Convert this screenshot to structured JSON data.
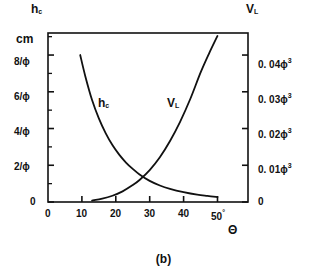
{
  "figure": {
    "caption": "(b)",
    "left_axis_name": "h",
    "left_axis_name_sub": "c",
    "left_axis_unit": "cm",
    "right_axis_name": "V",
    "right_axis_name_sub": "L",
    "x_axis_name": "Θ",
    "degree_mark": "°"
  },
  "curve_labels": {
    "hc": "h",
    "hc_sub": "c",
    "vl": "V",
    "vl_sub": "L"
  },
  "ticks": {
    "left": [
      "8/ϕ",
      "6/ϕ",
      "4/ϕ",
      "2/ϕ",
      "0"
    ],
    "right": [
      "0. 04ϕ",
      "0. 03ϕ",
      "0. 02ϕ",
      "0. 01ϕ",
      "0"
    ],
    "right_exp": "3",
    "x": [
      "0",
      "10",
      "20",
      "30",
      "40",
      "50"
    ]
  },
  "colors": {
    "axis": "#111111",
    "curve": "#111111",
    "background": "#ffffff"
  },
  "chart_data": {
    "type": "line",
    "title": "(b)",
    "xlabel": "Θ",
    "ylabel": "h_c (cm)",
    "y2label": "V_L",
    "grid": false,
    "legend": "inline-curve-labels",
    "xlim": [
      0,
      59
    ],
    "ylim": [
      0,
      9.2
    ],
    "y2lim": [
      0,
      0.046
    ],
    "xticks": [
      0,
      10,
      20,
      30,
      40,
      50
    ],
    "xticklabels": [
      "0",
      "10",
      "20",
      "30",
      "40",
      "50°"
    ],
    "yticks": [
      0,
      2,
      4,
      6,
      8
    ],
    "yticklabels": [
      "0",
      "2/ϕ",
      "4/ϕ",
      "6/ϕ",
      "8/ϕ"
    ],
    "y2ticks": [
      0,
      0.01,
      0.02,
      0.03,
      0.04
    ],
    "y2ticklabels": [
      "0",
      "0. 01ϕ³",
      "0. 02ϕ³",
      "0. 03ϕ³",
      "0. 04ϕ³"
    ],
    "series": [
      {
        "name": "h_c",
        "axis": "left",
        "x": [
          9.5,
          11,
          13,
          15,
          17,
          19,
          21,
          23,
          25,
          27,
          30,
          33,
          36,
          40,
          44,
          47,
          50
        ],
        "y": [
          8.0,
          6.85,
          5.55,
          4.55,
          3.75,
          3.1,
          2.58,
          2.15,
          1.8,
          1.5,
          1.15,
          0.9,
          0.72,
          0.54,
          0.4,
          0.33,
          0.27
        ]
      },
      {
        "name": "V_L",
        "axis": "right",
        "x": [
          13,
          16,
          19,
          22,
          25,
          27,
          30,
          33,
          36,
          39,
          42,
          45,
          47.5,
          50
        ],
        "y": [
          0.0004,
          0.0009,
          0.0017,
          0.0029,
          0.0046,
          0.006,
          0.0087,
          0.0122,
          0.0166,
          0.0219,
          0.0281,
          0.0352,
          0.0404,
          0.0452
        ]
      }
    ]
  }
}
